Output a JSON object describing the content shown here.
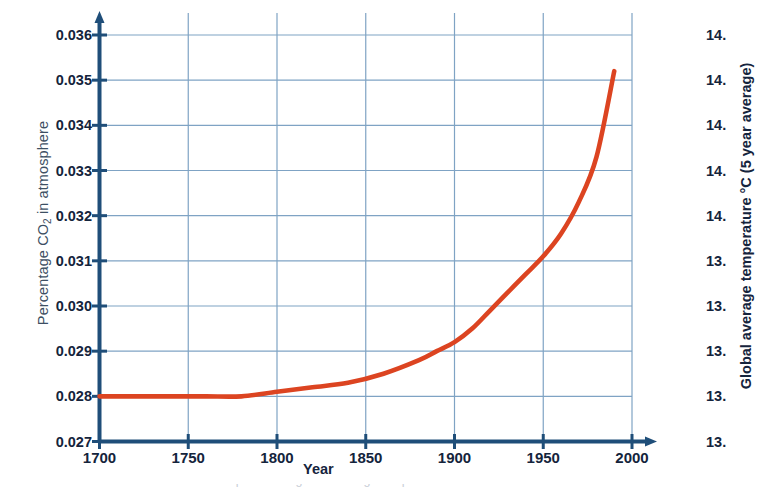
{
  "chart_data": {
    "type": "line",
    "title": "",
    "subtitle": "",
    "xlabel": "Year",
    "ylabel": "Percentage CO2 in atmosphere",
    "y2label": "Global average temperature °C (5 year average)",
    "xlim": [
      1700,
      2000
    ],
    "ylim": [
      0.027,
      0.036
    ],
    "y2lim": [
      13.0,
      14.8
    ],
    "grid": true,
    "legend": "none",
    "line_color": "#dc4421",
    "axis_color": "#1f4e79",
    "grid_color": "#7fa3c4",
    "xticks": [
      1700,
      1750,
      1800,
      1850,
      1900,
      1950,
      2000
    ],
    "xtick_labels": [
      "1700",
      "1750",
      "1800",
      "1850",
      "1900",
      "1950",
      "2000"
    ],
    "yticks": [
      0.027,
      0.028,
      0.029,
      0.03,
      0.031,
      0.032,
      0.033,
      0.034,
      0.035,
      0.036
    ],
    "ytick_labels": [
      "0.027",
      "0.028",
      "0.029",
      "0.030",
      "0.031",
      "0.032",
      "0.033",
      "0.034",
      "0.035",
      "0.036"
    ],
    "y2ticks": [
      13.0,
      13.2,
      13.4,
      13.6,
      13.8,
      14.0,
      14.2,
      14.4,
      14.6,
      14.8
    ],
    "y2tick_labels": [
      "13.",
      "13.",
      "13.",
      "13.",
      "13.",
      "14.",
      "14.",
      "14.",
      "14.",
      "14."
    ],
    "y2tick_labels_note": "right-hand tick labels are clipped by the image edge; only '14.' and '13.' are visible",
    "series": [
      {
        "name": "Percentage CO2 in atmosphere",
        "color": "#dc4421",
        "x": [
          1700,
          1720,
          1740,
          1760,
          1780,
          1800,
          1820,
          1840,
          1860,
          1880,
          1890,
          1900,
          1910,
          1920,
          1930,
          1940,
          1950,
          1960,
          1970,
          1980,
          1990
        ],
        "y": [
          0.028,
          0.028,
          0.028,
          0.028,
          0.028,
          0.0281,
          0.0282,
          0.0283,
          0.0285,
          0.0288,
          0.029,
          0.0292,
          0.0295,
          0.0299,
          0.0303,
          0.0307,
          0.0311,
          0.0316,
          0.0323,
          0.0333,
          0.0352
        ]
      }
    ],
    "annotations": []
  },
  "labels": {
    "y_left_title_main": "Percentage CO",
    "y_left_title_sub": "2",
    "y_left_title_tail": " in atmosphere",
    "y_right_title": "Global average temperature °C (5 year average)",
    "x_title": "Year",
    "caption_clipped": "Carbon dioxide in the atmosphere and global average temperature"
  }
}
